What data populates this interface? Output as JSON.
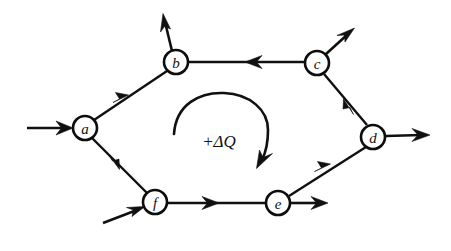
{
  "figure": {
    "background_color": "#ffffff",
    "ink_color": "#101010",
    "width": 451,
    "height": 251
  },
  "nodes": [
    {
      "id": "a",
      "label": "a",
      "cx": 85,
      "cy": 128,
      "r": 12
    },
    {
      "id": "b",
      "label": "b",
      "cx": 176,
      "cy": 62,
      "r": 12
    },
    {
      "id": "c",
      "label": "c",
      "cx": 317,
      "cy": 63,
      "r": 12
    },
    {
      "id": "d",
      "label": "d",
      "cx": 373,
      "cy": 137,
      "r": 12
    },
    {
      "id": "e",
      "label": "e",
      "cx": 278,
      "cy": 203,
      "r": 12
    },
    {
      "id": "f",
      "label": "f",
      "cx": 155,
      "cy": 202,
      "r": 12
    }
  ],
  "edges": [
    {
      "id": "a-b",
      "from": "a",
      "to": "b",
      "direction": "a→b",
      "arrow_at": {
        "x": 125,
        "y": 98
      }
    },
    {
      "id": "c-b",
      "from": "c",
      "to": "b",
      "direction": "c→b",
      "arrow_at": {
        "x": 249,
        "y": 62
      }
    },
    {
      "id": "d-c",
      "from": "d",
      "to": "c",
      "direction": "d→c",
      "arrow_at": {
        "x": 347,
        "y": 103
      }
    },
    {
      "id": "e-d",
      "from": "e",
      "to": "d",
      "direction": "e→d",
      "arrow_at": {
        "x": 327,
        "y": 167
      }
    },
    {
      "id": "f-e",
      "from": "f",
      "to": "e",
      "direction": "f→e",
      "arrow_at": {
        "x": 216,
        "y": 203
      }
    },
    {
      "id": "a-f",
      "from": "a",
      "to": "f",
      "direction": "a→f",
      "arrow_at": {
        "x": 116,
        "y": 166
      }
    }
  ],
  "external_arrows": [
    {
      "id": "in-a",
      "kind": "inflow",
      "into": "a",
      "from_point": {
        "x": 27,
        "y": 128
      },
      "to_point": {
        "x": 72,
        "y": 128
      }
    },
    {
      "id": "in-f",
      "kind": "inflow",
      "into": "f",
      "from_point": {
        "x": 103,
        "y": 223
      },
      "to_point": {
        "x": 144,
        "y": 207
      }
    },
    {
      "id": "out-b",
      "kind": "outflow",
      "from": "b",
      "from_point": {
        "x": 172,
        "y": 50
      },
      "to_point": {
        "x": 163,
        "y": 15
      }
    },
    {
      "id": "out-c",
      "kind": "outflow",
      "from": "c",
      "from_point": {
        "x": 326,
        "y": 54
      },
      "to_point": {
        "x": 353,
        "y": 29
      }
    },
    {
      "id": "out-d",
      "kind": "outflow",
      "from": "d",
      "from_point": {
        "x": 386,
        "y": 136
      },
      "to_point": {
        "x": 429,
        "y": 135
      }
    },
    {
      "id": "out-e",
      "kind": "outflow",
      "from": "e",
      "from_point": {
        "x": 291,
        "y": 203
      },
      "to_point": {
        "x": 327,
        "y": 203
      }
    }
  ],
  "loop": {
    "label": "+ΔQ",
    "label_x": 219,
    "label_y": 141,
    "rotation": "clockwise",
    "start_point": {
      "x": 174,
      "y": 134
    },
    "end_point": {
      "x": 263,
      "y": 162
    }
  }
}
